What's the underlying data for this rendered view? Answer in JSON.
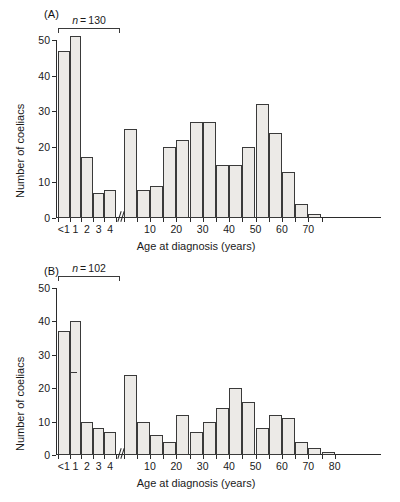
{
  "figure": {
    "panels": [
      {
        "id": "A",
        "label": "(A)",
        "annotation": {
          "prefix": "n",
          "eq": " = ",
          "value": "130",
          "full": "n = 130"
        }
      },
      {
        "id": "B",
        "label": "(B)",
        "annotation": {
          "prefix": "n",
          "eq": " = ",
          "value": "102",
          "full": "n = 102"
        }
      }
    ],
    "shared": {
      "ylabel": "Number of coeliacs",
      "xlabel": "Age at diagnosis (years)",
      "ytick_labels": [
        "0",
        "10",
        "20",
        "30",
        "40",
        "50"
      ],
      "xtick_labels_young": [
        "<1",
        "1",
        "2",
        "3",
        "4"
      ],
      "xtick_labels_old": [
        "10",
        "20",
        "30",
        "40",
        "50",
        "60",
        "70",
        "80"
      ],
      "axis_break_symbol": "//"
    }
  },
  "chart_data": [
    {
      "type": "bar",
      "panel": "A",
      "title": "(A)",
      "xlabel": "Age at diagnosis (years)",
      "ylabel": "Number of coeliacs",
      "ylim": [
        0,
        50
      ],
      "yticks": [
        0,
        10,
        20,
        30,
        40,
        50
      ],
      "grid": false,
      "legend": null,
      "annotation": "n = 130",
      "annotation_spans_categories": [
        "<1",
        "1",
        "2",
        "3",
        "4"
      ],
      "axis_break_after_category": "4",
      "categories": [
        "<1",
        "1",
        "2",
        "3",
        "4",
        "5-10",
        "10-15",
        "15-20",
        "20-25",
        "25-30",
        "30-35",
        "35-40",
        "40-45",
        "45-50",
        "50-55",
        "55-60",
        "60-65",
        "65-70",
        "70-75",
        "75-80"
      ],
      "values": [
        47,
        51,
        17,
        7,
        8,
        25,
        8,
        9,
        20,
        22,
        27,
        27,
        15,
        15,
        20,
        32,
        24,
        13,
        4,
        1
      ]
    },
    {
      "type": "bar",
      "panel": "B",
      "title": "(B)",
      "xlabel": "Age at diagnosis (years)",
      "ylabel": "Number of coeliacs",
      "ylim": [
        0,
        50
      ],
      "yticks": [
        0,
        10,
        20,
        30,
        40,
        50
      ],
      "grid": false,
      "legend": null,
      "annotation": "n = 102",
      "annotation_spans_categories": [
        "<1",
        "1",
        "2",
        "3",
        "4"
      ],
      "axis_break_after_category": "4",
      "categories": [
        "<1",
        "1",
        "2",
        "3",
        "4",
        "5-10",
        "10-15",
        "15-20",
        "20-25",
        "25-30",
        "30-35",
        "35-40",
        "40-45",
        "45-50",
        "50-55",
        "55-60",
        "60-65",
        "65-70",
        "70-75",
        "75-80",
        "80-85"
      ],
      "values": [
        37,
        40,
        10,
        8,
        7,
        24,
        10,
        6,
        4,
        12,
        7,
        10,
        14,
        20,
        16,
        8,
        12,
        11,
        4,
        2,
        1
      ]
    }
  ]
}
